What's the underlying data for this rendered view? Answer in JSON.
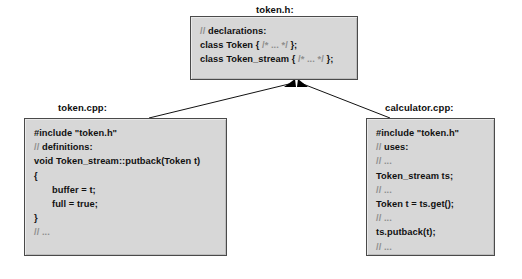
{
  "diagram": {
    "colors": {
      "box_fill": "#d7d7d7",
      "box_border": "#4a4a4a",
      "background": "#ffffff",
      "code_text": "#111111",
      "comment_text": "#8e8e8e",
      "arrow": "#000000"
    }
  },
  "header_box": {
    "label": "token.h:",
    "lines": [
      {
        "id": "h1",
        "prefix": "// ",
        "text": "declarations:",
        "comment": true
      },
      {
        "id": "h2",
        "text": "class Token { ",
        "comment_mid": "/* ... */",
        "suffix": " };"
      },
      {
        "id": "h3",
        "text": "class Token_stream { ",
        "comment_mid": "/* ... */",
        "suffix": " };"
      }
    ]
  },
  "impl_box": {
    "label": "token.cpp:",
    "lines": [
      {
        "id": "t1",
        "text": "#include \"token.h\""
      },
      {
        "id": "t2",
        "prefix": "// ",
        "text": "definitions:",
        "comment": true
      },
      {
        "id": "t3",
        "text": "void Token_stream::putback(Token t)"
      },
      {
        "id": "t4",
        "text": "{"
      },
      {
        "id": "t5",
        "text": "buffer = t;",
        "indent": true
      },
      {
        "id": "t6",
        "text": "full = true;",
        "indent": true
      },
      {
        "id": "t7",
        "text": "}"
      },
      {
        "id": "t8",
        "text": "// ...",
        "comment": true
      }
    ]
  },
  "user_box": {
    "label": "calculator.cpp:",
    "lines": [
      {
        "id": "c1",
        "text": "#include \"token.h\""
      },
      {
        "id": "c2",
        "prefix": "// ",
        "text": "uses:",
        "comment": true
      },
      {
        "id": "c3",
        "text": "// ...",
        "comment": true
      },
      {
        "id": "c4",
        "text": "Token_stream ts;"
      },
      {
        "id": "c5",
        "text": "// ...",
        "comment": true
      },
      {
        "id": "c6",
        "text": "Token t = ts.get();"
      },
      {
        "id": "c7",
        "text": "// ...",
        "comment": true
      },
      {
        "id": "c8",
        "text": "ts.putback(t);"
      },
      {
        "id": "c9",
        "text": "// ...",
        "comment": true
      }
    ]
  }
}
